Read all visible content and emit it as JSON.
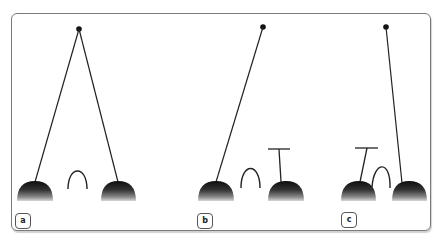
{
  "figure": {
    "panels": [
      {
        "label": "a",
        "description": "Pivot point with two cords descending to two domes; free arch between them"
      },
      {
        "label": "b",
        "description": "Single cord from pivot to left dome; arch; T-bar standing on right dome"
      },
      {
        "label": "c",
        "description": "T-bar on left dome; arch resting against left dome; cord from pivot to right dome"
      }
    ],
    "colors": {
      "stroke": "#222222",
      "frame": "#7a7a7a",
      "dome_top": "#111111",
      "dome_bottom": "#bdbdbd"
    }
  }
}
